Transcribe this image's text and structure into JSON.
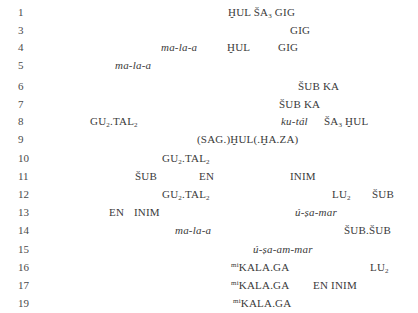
{
  "document": {
    "rows": [
      {
        "line": "1",
        "top": 12,
        "tokens": [
          {
            "x": 228,
            "italic": false,
            "html": "ḪUL ŠA<sub>3</sub> GIG"
          }
        ]
      },
      {
        "line": "3",
        "top": 30,
        "tokens": [
          {
            "x": 290,
            "italic": false,
            "html": "GIG"
          }
        ]
      },
      {
        "line": "4",
        "top": 47,
        "tokens": [
          {
            "x": 161,
            "italic": true,
            "html": "ma-la-a"
          },
          {
            "x": 227,
            "italic": false,
            "html": "ḪUL"
          },
          {
            "x": 278,
            "italic": false,
            "html": "GIG"
          }
        ]
      },
      {
        "line": "5",
        "top": 65,
        "tokens": [
          {
            "x": 115,
            "italic": true,
            "html": "ma-la-a"
          }
        ]
      },
      {
        "line": "6",
        "top": 86,
        "tokens": [
          {
            "x": 298,
            "italic": false,
            "html": "ŠUB KA"
          }
        ]
      },
      {
        "line": "7",
        "top": 104,
        "tokens": [
          {
            "x": 279,
            "italic": false,
            "html": "ŠUB KA"
          }
        ]
      },
      {
        "line": "8",
        "top": 121,
        "tokens": [
          {
            "x": 90,
            "italic": false,
            "html": "GU<sub>2</sub>.TAL<sub>2</sub>"
          },
          {
            "x": 281,
            "italic": true,
            "html": "ku-tál"
          },
          {
            "x": 324,
            "italic": false,
            "html": "ŠA<sub>3</sub> ḪUL"
          }
        ]
      },
      {
        "line": "9",
        "top": 139,
        "tokens": [
          {
            "x": 197,
            "italic": false,
            "html": "(SAG.)ḪUL(.ḪA.ZA)"
          }
        ]
      },
      {
        "line": "10",
        "top": 158,
        "tokens": [
          {
            "x": 162,
            "italic": false,
            "html": "GU<sub>2</sub>.TAL<sub>2</sub>"
          }
        ]
      },
      {
        "line": "11",
        "top": 176,
        "tokens": [
          {
            "x": 135,
            "italic": false,
            "html": "ŠUB"
          },
          {
            "x": 199,
            "italic": false,
            "html": "EN"
          },
          {
            "x": 290,
            "italic": false,
            "html": "INIM"
          }
        ]
      },
      {
        "line": "12",
        "top": 194,
        "tokens": [
          {
            "x": 162,
            "italic": false,
            "html": "GU<sub>2</sub>.TAL<sub>2</sub>"
          },
          {
            "x": 332,
            "italic": false,
            "html": "LU<sub>2</sub>"
          },
          {
            "x": 372,
            "italic": false,
            "html": "ŠUB"
          }
        ]
      },
      {
        "line": "13",
        "top": 212,
        "tokens": [
          {
            "x": 109,
            "italic": false,
            "html": "EN"
          },
          {
            "x": 134,
            "italic": false,
            "html": "INIM"
          },
          {
            "x": 295,
            "italic": true,
            "html": "ú-ṣa-mar"
          }
        ]
      },
      {
        "line": "14",
        "top": 230,
        "tokens": [
          {
            "x": 175,
            "italic": true,
            "html": "ma-la-a"
          },
          {
            "x": 344,
            "italic": false,
            "html": "ŠUB.ŠUB"
          }
        ]
      },
      {
        "line": "15",
        "top": 249,
        "tokens": [
          {
            "x": 253,
            "italic": true,
            "html": "ú-ṣa-am-mar"
          }
        ]
      },
      {
        "line": "16",
        "top": 267,
        "tokens": [
          {
            "x": 231,
            "italic": false,
            "html": "<sup>mi</sup>KALA.GA"
          },
          {
            "x": 370,
            "italic": false,
            "html": "LU<sub>2</sub>"
          }
        ]
      },
      {
        "line": "17",
        "top": 285,
        "tokens": [
          {
            "x": 231,
            "italic": false,
            "html": "<sup>mi</sup>KALA.GA"
          },
          {
            "x": 313,
            "italic": false,
            "html": "EN INIM"
          }
        ]
      },
      {
        "line": "19",
        "top": 303,
        "tokens": [
          {
            "x": 233,
            "italic": false,
            "html": "<sup>mi</sup>KALA.GA"
          }
        ]
      }
    ]
  }
}
